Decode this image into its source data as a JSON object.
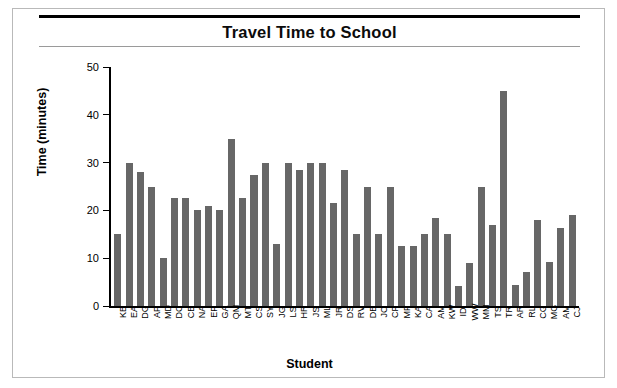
{
  "chart_data": {
    "type": "bar",
    "title": "Travel Time to School",
    "xlabel": "Student",
    "ylabel": "Time (minutes)",
    "ylim": [
      0,
      50
    ],
    "yticks": [
      0,
      10,
      20,
      30,
      40,
      50
    ],
    "grid": false,
    "legend": null,
    "bar_color": "#676767",
    "categories": [
      "KB",
      "EA",
      "DG",
      "AP",
      "MD",
      "DC",
      "CB",
      "NA",
      "EF",
      "GA",
      "QM",
      "MT",
      "CS",
      "SY",
      "JG",
      "LS",
      "HR",
      "JS",
      "ML",
      "JR",
      "DS",
      "RV",
      "DB",
      "JC",
      "CF",
      "MF",
      "KA",
      "CA",
      "AM",
      "KW",
      "ID",
      "WW",
      "MM",
      "TS",
      "TR",
      "AR",
      "RL",
      "CG",
      "MG",
      "AM",
      "CJ"
    ],
    "values": [
      15,
      30,
      28,
      25,
      10,
      22.5,
      22.5,
      20,
      21,
      20,
      35,
      22.5,
      27.5,
      30,
      13,
      30,
      28.5,
      30,
      30,
      21.5,
      28.5,
      15,
      25,
      15,
      25,
      12.5,
      12.5,
      15,
      18.5,
      15,
      4.2,
      9,
      25,
      17,
      45,
      4.5,
      7.2,
      18,
      9.2,
      16.3,
      19
    ]
  }
}
